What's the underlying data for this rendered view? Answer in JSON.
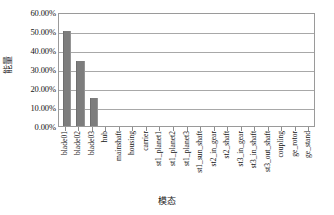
{
  "chart_data": {
    "type": "bar",
    "title": "",
    "xlabel": "模态",
    "ylabel": "能量",
    "ylim": [
      0,
      60
    ],
    "ytick_labels": [
      "60.00%",
      "50.00%",
      "40.00%",
      "30.00%",
      "20.00%",
      "10.00%",
      "0.00%"
    ],
    "ytick_values": [
      60,
      50,
      40,
      30,
      20,
      10,
      0
    ],
    "grid": true,
    "legend": "none",
    "axis_unit": "percent",
    "categories": [
      "blade01",
      "blade02",
      "blade03",
      "hub",
      "mainshaft",
      "housing",
      "carrier",
      "st1_planet1",
      "st1_planet2",
      "st1_planet3",
      "st1_sun_shaft",
      "st2_in_gear",
      "st2_shaft",
      "st3_in_gear",
      "st3_in_shaft",
      "st3_out_shaft",
      "coupling",
      "ge_rotor",
      "ge_stand"
    ],
    "values": [
      50.0,
      34.0,
      14.5,
      0,
      0,
      0,
      0,
      0,
      0,
      0,
      0,
      0,
      0,
      0,
      0,
      0,
      0,
      0,
      0
    ],
    "bar_color": "#7d7d7d",
    "gridline_color": "#a8a8a8",
    "frame_color": "#9a9a9a",
    "background_color": "#ffffff"
  }
}
